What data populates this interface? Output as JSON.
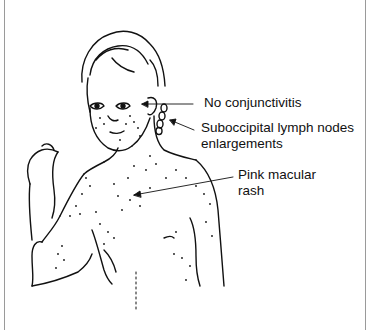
{
  "figure": {
    "annotations": [
      {
        "id": "conjunctivitis",
        "line1": "No conjunctivitis",
        "line2": ""
      },
      {
        "id": "lymph-nodes",
        "line1": "Suboccipital lymph nodes",
        "line2": "enlargements"
      },
      {
        "id": "rash",
        "line1": "Pink macular",
        "line2": "rash"
      }
    ]
  }
}
